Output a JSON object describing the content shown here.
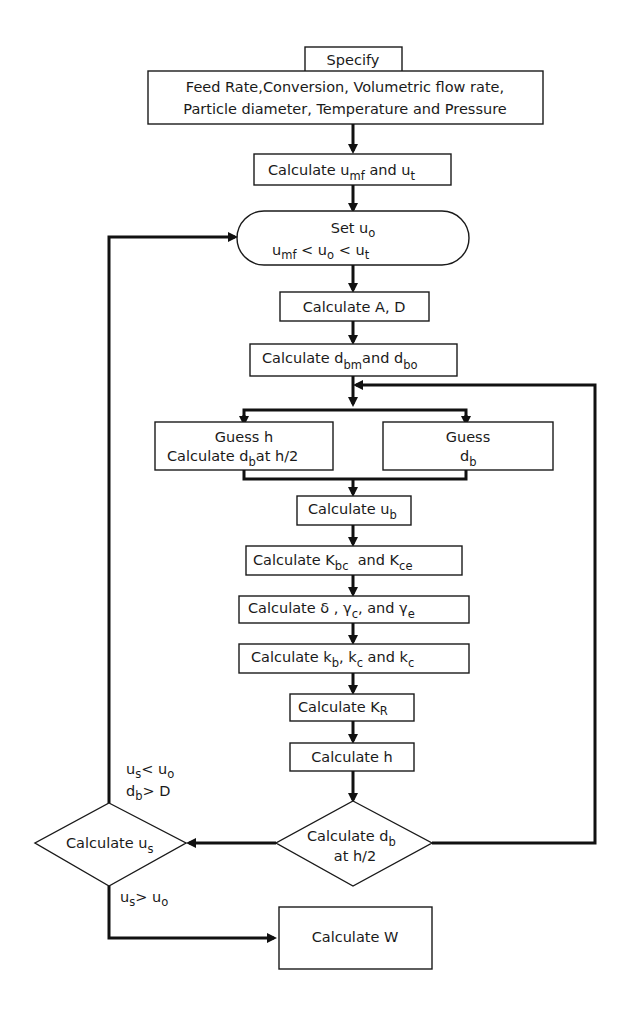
{
  "diagram": {
    "type": "flowchart",
    "colors": {
      "stroke": "#1a1a1a",
      "background": "#ffffff"
    },
    "nodes": {
      "specify_header": "Specify",
      "specify_line1": "Feed Rate,Conversion, Volumetric flow rate,",
      "specify_line2": "Particle diameter, Temperature and Pressure",
      "calc_umf_ut": {
        "pre": "Calculate u",
        "s1": "mf",
        "mid": " and u",
        "s2": "t"
      },
      "set_u0": {
        "line1_pre": "Set u",
        "line1_sub": "o",
        "l2_a": "u",
        "l2_a_sub": "mf",
        "l2_b": " < u",
        "l2_b_sub": "o",
        "l2_c": " < u",
        "l2_c_sub": "t"
      },
      "calc_A_D": "Calculate A, D",
      "calc_dbm_dbo": {
        "pre": "Calculate d",
        "s1": "bm",
        "mid": "and d",
        "s2": "bo"
      },
      "guess_h": {
        "line1": "Guess h",
        "line2_pre": "Calculate d",
        "line2_sub": "b",
        "line2_post": "at h/2"
      },
      "guess_db": {
        "line1": "Guess",
        "line2_pre": "d",
        "line2_sub": "b"
      },
      "calc_ub": {
        "pre": "Calculate u",
        "s1": "b"
      },
      "calc_Kbc_Kce": {
        "pre": "Calculate K",
        "s1": "bc",
        "mid": "  and K",
        "s2": "ce"
      },
      "calc_delta": {
        "pre": "Calculate δ , γ",
        "s1": "c",
        "mid": ", and γ",
        "s2": "e"
      },
      "calc_kb_kc": {
        "pre": "Calculate k",
        "s1": "b",
        "mid": ", k",
        "s2": "c",
        "mid2": " and k",
        "s3": "c"
      },
      "calc_KR": {
        "pre": "Calculate K",
        "s1": "R"
      },
      "calc_h": "Calculate h",
      "calc_db_decision": {
        "line1_pre": "Calculate d",
        "line1_sub": "b",
        "line2": "at h/2"
      },
      "calc_us_decision": {
        "pre": "Calculate u",
        "s1": "s"
      },
      "calc_W": "Calculate W"
    },
    "edge_labels": {
      "loop_condition": {
        "a": "u",
        "a_sub": "s",
        "a_rel": "< u",
        "a_sub2": "o",
        "b": "d",
        "b_sub": "b",
        "b_rel": "> D"
      },
      "exit_condition": {
        "a": "u",
        "a_sub": "s",
        "a_rel": "> u",
        "a_sub2": "o"
      }
    }
  }
}
